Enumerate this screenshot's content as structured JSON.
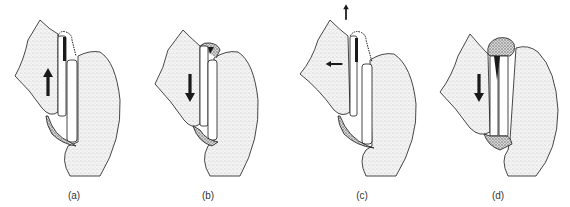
{
  "figure": {
    "background": "#ffffff",
    "ink_color": "#1a1a1a",
    "stipple_color": "#9a9a9a",
    "panels": [
      {
        "id": "a",
        "label": "(a)",
        "label_x": 74,
        "label_y": 190,
        "offset_x": 0,
        "arrows": [
          {
            "dir": "up",
            "x": 48,
            "y": 82
          }
        ],
        "variant": "a"
      },
      {
        "id": "b",
        "label": "(b)",
        "label_x": 208,
        "label_y": 190,
        "offset_x": 140,
        "arrows": [
          {
            "dir": "down",
            "x": 190,
            "y": 88
          }
        ],
        "variant": "b"
      },
      {
        "id": "c",
        "label": "(c)",
        "label_x": 362,
        "label_y": 190,
        "offset_x": 290,
        "arrows": [
          {
            "dir": "up",
            "x": 346,
            "y": 12
          },
          {
            "dir": "left",
            "x": 334,
            "y": 64
          }
        ],
        "variant": "c"
      },
      {
        "id": "d",
        "label": "(d)",
        "label_x": 498,
        "label_y": 190,
        "offset_x": 420,
        "arrows": [
          {
            "dir": "down",
            "x": 479,
            "y": 88
          }
        ],
        "variant": "d"
      }
    ]
  }
}
